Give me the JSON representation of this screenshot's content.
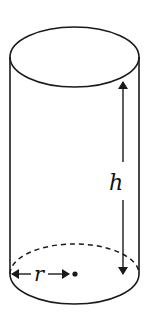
{
  "diagram": {
    "type": "cylinder",
    "labels": {
      "height": "h",
      "radius": "r"
    },
    "colors": {
      "stroke": "#1a1a1a",
      "background": "#ffffff"
    }
  }
}
